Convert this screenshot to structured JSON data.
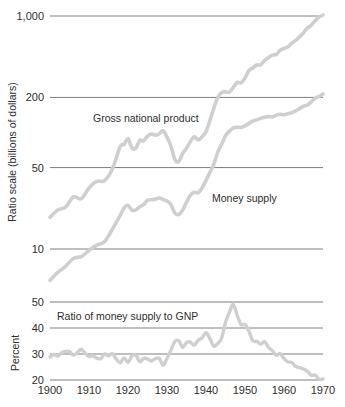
{
  "chart_data": [
    {
      "type": "line",
      "panel": "upper",
      "title": "",
      "xlabel": "",
      "ylabel": "Ratio scale (billions of dollars)",
      "yscale": "log",
      "ylim": [
        7,
        1200
      ],
      "xlim": [
        1900,
        1970
      ],
      "grid": true,
      "ytick_labels": [
        "1,000",
        "200",
        "50",
        "10"
      ],
      "ytick_values": [
        1000,
        200,
        50,
        10
      ],
      "xtick_labels": [
        "1900",
        "1910",
        "1920",
        "1930",
        "1940",
        "1950",
        "1960",
        "1970"
      ],
      "xtick_values": [
        1900,
        1910,
        1920,
        1930,
        1940,
        1950,
        1960,
        1970
      ],
      "legend_position": "inline-annotation",
      "series": [
        {
          "name": "Gross national product",
          "label_x": 1907,
          "label_y": 150,
          "color": "#cfcfcf",
          "x": [
            1900,
            1902,
            1904,
            1906,
            1908,
            1910,
            1912,
            1914,
            1916,
            1918,
            1919,
            1920,
            1921,
            1922,
            1923,
            1924,
            1925,
            1926,
            1927,
            1928,
            1929,
            1930,
            1931,
            1932,
            1933,
            1934,
            1935,
            1936,
            1937,
            1938,
            1939,
            1940,
            1941,
            1942,
            1943,
            1944,
            1945,
            1946,
            1947,
            1948,
            1949,
            1950,
            1951,
            1952,
            1953,
            1954,
            1955,
            1956,
            1957,
            1958,
            1959,
            1960,
            1961,
            1962,
            1963,
            1964,
            1965,
            1966,
            1967,
            1968,
            1969,
            1970
          ],
          "values": [
            18.7,
            21.6,
            22.9,
            28.0,
            27.0,
            33.4,
            38.0,
            38.6,
            48.9,
            75.8,
            78.9,
            88.4,
            73.6,
            73.4,
            85.4,
            84.7,
            93.1,
            97.0,
            94.9,
            97.0,
            103.6,
            91.2,
            76.5,
            58.7,
            56.4,
            66.0,
            73.3,
            83.8,
            91.9,
            86.1,
            92.2,
            101.4,
            126.7,
            161.9,
            198.6,
            219.8,
            223.1,
            222.3,
            244.2,
            269.2,
            267.3,
            293.8,
            339.3,
            358.3,
            379.4,
            380.4,
            414.8,
            437.5,
            461.1,
            467.2,
            506.6,
            526.4,
            544.7,
            585.6,
            617.7,
            663.6,
            719.1,
            787.8,
            833.6,
            910.6,
            982.2,
            1020.0
          ]
        },
        {
          "name": "Money supply",
          "label_x": 1940,
          "label_y": 27,
          "color": "#cfcfcf",
          "x": [
            1900,
            1902,
            1904,
            1906,
            1908,
            1910,
            1912,
            1914,
            1916,
            1918,
            1919,
            1920,
            1921,
            1922,
            1923,
            1924,
            1925,
            1926,
            1927,
            1928,
            1929,
            1930,
            1931,
            1932,
            1933,
            1934,
            1935,
            1936,
            1937,
            1938,
            1939,
            1940,
            1941,
            1942,
            1943,
            1944,
            1945,
            1946,
            1947,
            1948,
            1949,
            1950,
            1951,
            1952,
            1953,
            1954,
            1955,
            1956,
            1957,
            1958,
            1959,
            1960,
            1961,
            1962,
            1963,
            1964,
            1965,
            1966,
            1967,
            1968,
            1969,
            1970
          ],
          "values": [
            5.4,
            6.3,
            7.1,
            8.3,
            8.6,
            9.7,
            10.8,
            11.6,
            14.8,
            19.4,
            22.5,
            23.7,
            21.5,
            21.7,
            23.1,
            24.0,
            26.2,
            26.5,
            26.8,
            27.4,
            26.6,
            25.8,
            24.1,
            20.4,
            19.8,
            21.5,
            25.2,
            29.0,
            30.7,
            30.4,
            33.4,
            38.7,
            45.5,
            53.4,
            67.6,
            79.4,
            94.0,
            102.5,
            109.6,
            111.0,
            110.6,
            114.1,
            119.2,
            125.2,
            128.3,
            132.3,
            135.2,
            136.9,
            135.9,
            141.1,
            143.4,
            141.8,
            145.5,
            147.8,
            153.3,
            160.3,
            167.9,
            172.1,
            183.1,
            197.4,
            203.6,
            214.4
          ]
        }
      ]
    },
    {
      "type": "line",
      "panel": "lower",
      "title": "",
      "xlabel": "",
      "ylabel": "Percent",
      "yscale": "linear",
      "ylim": [
        19,
        52
      ],
      "xlim": [
        1900,
        1970
      ],
      "grid": true,
      "ytick_labels": [
        "50",
        "40",
        "30",
        "20"
      ],
      "ytick_values": [
        50,
        40,
        30,
        20
      ],
      "xtick_labels": [
        "1900",
        "1910",
        "1920",
        "1930",
        "1940",
        "1950",
        "1960",
        "1970"
      ],
      "xtick_values": [
        1900,
        1910,
        1920,
        1930,
        1940,
        1950,
        1960,
        1970
      ],
      "legend_position": "inline-annotation",
      "series": [
        {
          "name": "Ratio of money supply to GNP",
          "label_x": 1903,
          "label_y": 45.5,
          "color": "#cfcfcf",
          "x": [
            1900,
            1901,
            1902,
            1903,
            1904,
            1905,
            1906,
            1907,
            1908,
            1909,
            1910,
            1911,
            1912,
            1913,
            1914,
            1915,
            1916,
            1917,
            1918,
            1919,
            1920,
            1921,
            1922,
            1923,
            1924,
            1925,
            1926,
            1927,
            1928,
            1929,
            1930,
            1931,
            1932,
            1933,
            1934,
            1935,
            1936,
            1937,
            1938,
            1939,
            1940,
            1941,
            1942,
            1943,
            1944,
            1945,
            1946,
            1947,
            1948,
            1949,
            1950,
            1951,
            1952,
            1953,
            1954,
            1955,
            1956,
            1957,
            1958,
            1959,
            1960,
            1961,
            1962,
            1963,
            1964,
            1965,
            1966,
            1967,
            1968,
            1969,
            1970
          ],
          "values": [
            28.9,
            29.8,
            29.2,
            30.5,
            31.0,
            30.9,
            29.6,
            30.5,
            31.8,
            30.4,
            29.0,
            29.3,
            28.4,
            28.2,
            30.0,
            29.3,
            30.2,
            28.0,
            26.6,
            28.5,
            26.8,
            29.2,
            29.6,
            27.0,
            28.3,
            28.1,
            27.3,
            28.2,
            28.3,
            25.7,
            28.3,
            31.5,
            34.8,
            35.1,
            32.6,
            34.4,
            34.6,
            33.4,
            35.3,
            36.2,
            38.2,
            35.9,
            33.0,
            34.0,
            36.1,
            42.1,
            46.1,
            49.0,
            44.9,
            41.3,
            41.4,
            38.8,
            35.1,
            34.9,
            33.8,
            34.8,
            32.6,
            31.3,
            29.5,
            30.2,
            28.3,
            26.9,
            26.7,
            25.2,
            24.8,
            24.2,
            23.3,
            21.8,
            21.9,
            20.2,
            20.4,
            21.0
          ]
        }
      ]
    }
  ],
  "upper_panel": {
    "y_axis_title": "Ratio scale (billions of dollars)",
    "y_ticks": [
      "1,000",
      "200",
      "50",
      "10"
    ],
    "annotations": [
      {
        "text": "Gross national product"
      },
      {
        "text": "Money supply"
      }
    ]
  },
  "lower_panel": {
    "y_axis_title": "Percent",
    "y_ticks": [
      "50",
      "40",
      "30",
      "20"
    ],
    "annotations": [
      {
        "text": "Ratio of money supply to GNP"
      }
    ]
  },
  "x_axis": {
    "ticks": [
      "1900",
      "1910",
      "1920",
      "1930",
      "1940",
      "1950",
      "1960",
      "1970"
    ]
  },
  "colors": {
    "series": "#cfcfcf",
    "gridline": "#6f6f6f",
    "text": "#2e2e2e",
    "background": "#ffffff"
  }
}
